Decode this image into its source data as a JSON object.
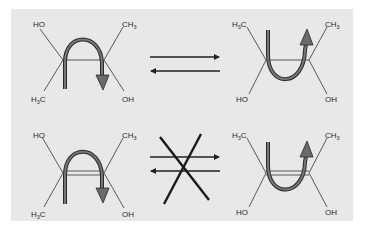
{
  "figure": {
    "background_color": "#e8e8e8",
    "line_color": "#333333",
    "arrow_fill_color": "#707070",
    "arrow_outline_color": "#2a2a2a"
  },
  "rows": [
    {
      "name": "allowed-interconversion",
      "left_molecule": {
        "top_left": "HO",
        "top_right": {
          "main": "CH",
          "sub": "3"
        },
        "bottom_left": {
          "main": "H",
          "sub": "3",
          "tail": "C"
        },
        "bottom_right": "OH",
        "rotation_arrow": "clockwise-over-top"
      },
      "equilibrium": "forward-and-reverse-arrows",
      "right_molecule": {
        "top_left": {
          "main": "H",
          "sub": "3",
          "tail": "C"
        },
        "top_right": {
          "main": "CH",
          "sub": "3"
        },
        "bottom_left": "HO",
        "bottom_right": "OH",
        "rotation_arrow": "under-bottom-upward"
      }
    },
    {
      "name": "forbidden-interconversion",
      "left_molecule": {
        "top_left": "HO",
        "top_right": {
          "main": "CH",
          "sub": "3"
        },
        "bottom_left": {
          "main": "H",
          "sub": "3",
          "tail": "C"
        },
        "bottom_right": "OH",
        "rotation_arrow": "clockwise-over-top"
      },
      "equilibrium": "crossed-out-forward-and-reverse-arrows",
      "right_molecule": {
        "top_left": {
          "main": "H",
          "sub": "3",
          "tail": "C"
        },
        "top_right": {
          "main": "CH",
          "sub": "3"
        },
        "bottom_left": "HO",
        "bottom_right": "OH",
        "rotation_arrow": "under-bottom-upward"
      }
    }
  ]
}
